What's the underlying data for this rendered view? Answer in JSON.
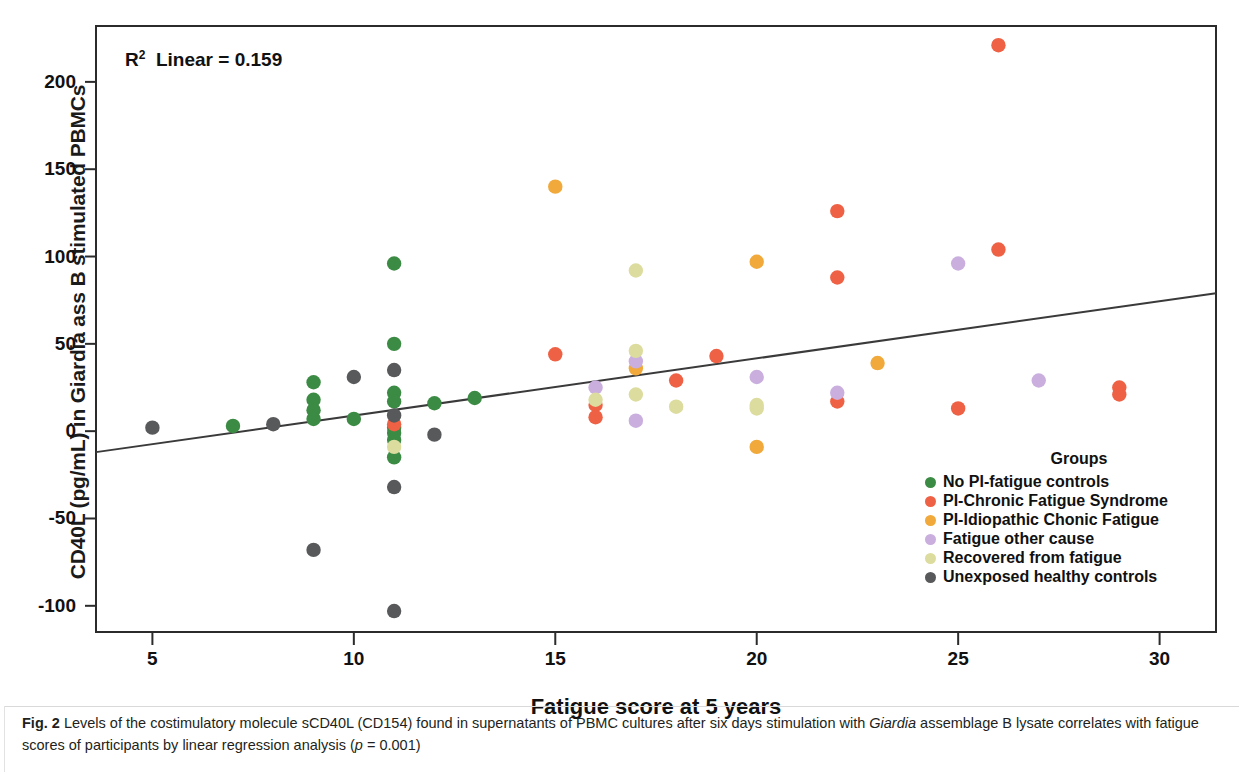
{
  "figure": {
    "annotation": "R2 Linear = 0.159",
    "annotation_prefix": "R",
    "annotation_sup": "2",
    "annotation_rest": "Linear = 0.159"
  },
  "axes": {
    "xlabel": "Fatigue score at 5 years",
    "ylabel": "CD40L (pg/mL) in Giardia ass B stimulated PBMCs",
    "xticks": [
      5,
      10,
      15,
      20,
      25,
      30
    ],
    "yticks": [
      200,
      150,
      100,
      50,
      0,
      -50,
      -100
    ],
    "ytick_labels": [
      "200",
      "150",
      "100",
      "50",
      "0",
      "-50",
      "-100"
    ],
    "xtick_labels": [
      "5",
      "10",
      "15",
      "20",
      "25",
      "30"
    ]
  },
  "legend": {
    "title": "Groups",
    "items": [
      {
        "label": "No PI-fatigue controls",
        "color": "#3c8b44"
      },
      {
        "label": "PI-Chronic Fatigue Syndrome",
        "color": "#ef6144"
      },
      {
        "label": "PI-Idiopathic Chonic Fatigue",
        "color": "#f0a93a"
      },
      {
        "label": "Fatigue other cause",
        "color": "#c9aede"
      },
      {
        "label": "Recovered from fatigue",
        "color": "#dcdc9e"
      },
      {
        "label": "Unexposed healthy controls",
        "color": "#58595b"
      }
    ]
  },
  "caption": {
    "label": "Fig. 2",
    "text_1": "Levels of the costimulatory molecule sCD40L (CD154) found in supernatants of PBMC cultures after six days stimulation with ",
    "italic_1": "Giardia",
    "text_2": " assemblage B lysate correlates with fatigue scores of participants by linear regression analysis (",
    "italic_2": "p",
    "text_3": " = 0.001)"
  },
  "chart_data": {
    "type": "scatter",
    "title": "",
    "xlabel": "Fatigue score at 5 years",
    "ylabel": "CD40L (pg/mL) in Giardia ass B stimulated PBMCs",
    "xlim": [
      3.6,
      31.4
    ],
    "ylim": [
      -115,
      232
    ],
    "grid": false,
    "legend_position": "inside-bottom-right",
    "annotations": [
      {
        "text": "R2 Linear = 0.159",
        "x": 5.3,
        "y": 218
      }
    ],
    "regression_line": {
      "type": "linear",
      "r_squared": 0.159,
      "p_value": 0.001,
      "x_start": 3.6,
      "y_start": -12,
      "x_end": 31.4,
      "y_end": 79
    },
    "series": [
      {
        "name": "No PI-fatigue controls",
        "color": "#3c8b44",
        "points": [
          [
            7,
            3
          ],
          [
            9,
            28
          ],
          [
            9,
            18
          ],
          [
            9,
            12
          ],
          [
            9,
            7
          ],
          [
            10,
            7
          ],
          [
            11,
            96
          ],
          [
            11,
            50
          ],
          [
            11,
            22
          ],
          [
            11,
            17
          ],
          [
            11,
            2
          ],
          [
            11,
            -1
          ],
          [
            11,
            -5
          ],
          [
            11,
            -15
          ],
          [
            12,
            16
          ],
          [
            13,
            19
          ]
        ]
      },
      {
        "name": "PI-Chronic Fatigue Syndrome",
        "color": "#ef6144",
        "points": [
          [
            11,
            4
          ],
          [
            15,
            44
          ],
          [
            16,
            15
          ],
          [
            16,
            8
          ],
          [
            18,
            29
          ],
          [
            19,
            43
          ],
          [
            22,
            126
          ],
          [
            22,
            88
          ],
          [
            22,
            17
          ],
          [
            25,
            13
          ],
          [
            26,
            221
          ],
          [
            26,
            104
          ],
          [
            29,
            25
          ],
          [
            29,
            21
          ]
        ]
      },
      {
        "name": "PI-Idiopathic Chonic Fatigue",
        "color": "#f0a93a",
        "points": [
          [
            15,
            140
          ],
          [
            17,
            36
          ],
          [
            20,
            97
          ],
          [
            20,
            -9
          ],
          [
            23,
            39
          ]
        ]
      },
      {
        "name": "Fatigue other cause",
        "color": "#c9aede",
        "points": [
          [
            16,
            25
          ],
          [
            17,
            40
          ],
          [
            17,
            6
          ],
          [
            20,
            31
          ],
          [
            22,
            22
          ],
          [
            25,
            96
          ],
          [
            27,
            29
          ]
        ]
      },
      {
        "name": "Recovered from fatigue",
        "color": "#dcdc9e",
        "points": [
          [
            11,
            -9
          ],
          [
            16,
            18
          ],
          [
            17,
            92
          ],
          [
            17,
            46
          ],
          [
            17,
            21
          ],
          [
            18,
            14
          ],
          [
            20,
            15
          ],
          [
            20,
            13
          ]
        ]
      },
      {
        "name": "Unexposed healthy controls",
        "color": "#58595b",
        "points": [
          [
            5,
            2
          ],
          [
            8,
            4
          ],
          [
            9,
            -68
          ],
          [
            10,
            31
          ],
          [
            11,
            35
          ],
          [
            11,
            9
          ],
          [
            11,
            -32
          ],
          [
            11,
            -103
          ],
          [
            12,
            -2
          ]
        ]
      }
    ]
  }
}
